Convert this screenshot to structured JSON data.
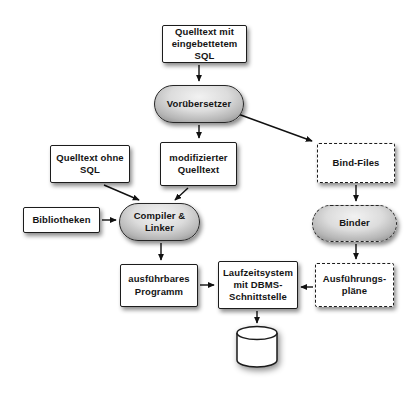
{
  "diagram": {
    "nodes": {
      "quelltext_mit_sql": {
        "label": "Quelltext mit\neingebettetem\nSQL",
        "shape": "rect",
        "border": "solid"
      },
      "voruebersetzer": {
        "label": "Vorübersetzer",
        "shape": "pill",
        "border": "solid"
      },
      "quelltext_ohne_sql": {
        "label": "Quelltext ohne\nSQL",
        "shape": "rect",
        "border": "solid"
      },
      "modifizierter_quelltext": {
        "label": "modifizierter\nQuelltext",
        "shape": "rect",
        "border": "solid"
      },
      "bind_files": {
        "label": "Bind-Files",
        "shape": "rect",
        "border": "dashed"
      },
      "bibliotheken": {
        "label": "Bibliotheken",
        "shape": "rect",
        "border": "solid"
      },
      "compiler_linker": {
        "label": "Compiler &\nLinker",
        "shape": "pill",
        "border": "solid"
      },
      "binder": {
        "label": "Binder",
        "shape": "pill",
        "border": "dashed"
      },
      "ausfuehrbares_programm": {
        "label": "ausführbares\nProgramm",
        "shape": "rect",
        "border": "solid"
      },
      "laufzeitsystem": {
        "label": "Laufzeitsystem\nmit DBMS-\nSchnittstelle",
        "shape": "rect",
        "border": "solid"
      },
      "ausfuehrungsplaene": {
        "label": "Ausführungs-\npläne",
        "shape": "rect",
        "border": "dashed"
      },
      "datenbank": {
        "label": "",
        "shape": "cylinder",
        "border": "solid"
      }
    },
    "edges": [
      {
        "from": "quelltext_mit_sql",
        "to": "voruebersetzer"
      },
      {
        "from": "voruebersetzer",
        "to": "modifizierter_quelltext"
      },
      {
        "from": "voruebersetzer",
        "to": "bind_files"
      },
      {
        "from": "quelltext_ohne_sql",
        "to": "compiler_linker"
      },
      {
        "from": "modifizierter_quelltext",
        "to": "compiler_linker"
      },
      {
        "from": "bibliotheken",
        "to": "compiler_linker"
      },
      {
        "from": "compiler_linker",
        "to": "ausfuehrbares_programm"
      },
      {
        "from": "ausfuehrbares_programm",
        "to": "laufzeitsystem"
      },
      {
        "from": "bind_files",
        "to": "binder"
      },
      {
        "from": "binder",
        "to": "ausfuehrungsplaene"
      },
      {
        "from": "ausfuehrungsplaene",
        "to": "laufzeitsystem"
      },
      {
        "from": "laufzeitsystem",
        "to": "datenbank"
      }
    ],
    "colors": {
      "background": "#ffffff",
      "node_fill": "#ffffff",
      "node_border": "#1c1c1c",
      "pill_gradient_light": "#f2f2f2",
      "pill_gradient_dark": "#7e7e7e",
      "arrow": "#111111",
      "text": "#141414"
    }
  }
}
